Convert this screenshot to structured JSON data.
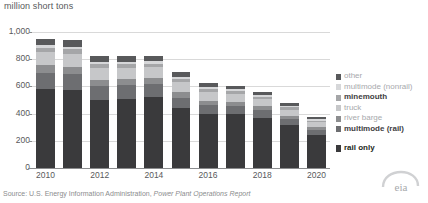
{
  "chart_data": {
    "type": "bar",
    "subtype": "stacked-bar",
    "title": "",
    "ylabel": "million short tons",
    "xlabel": "",
    "ylim": [
      0,
      1000
    ],
    "yticks": [
      0,
      200,
      400,
      600,
      800,
      1000
    ],
    "ytick_labels": [
      "0",
      "200",
      "400",
      "600",
      "800",
      "1,000"
    ],
    "grid": true,
    "legend_position": "right",
    "categories": [
      2010,
      2011,
      2012,
      2013,
      2014,
      2015,
      2016,
      2017,
      2018,
      2019,
      2020
    ],
    "xtick_labels": [
      "2010",
      "",
      "2012",
      "",
      "2014",
      "",
      "2016",
      "",
      "2018",
      "",
      "2020"
    ],
    "series": [
      {
        "name": "rail only",
        "color": "#3a3a3c",
        "values": [
          582,
          575,
          500,
          508,
          524,
          440,
          395,
          396,
          370,
          313,
          244
        ]
      },
      {
        "name": "multimode (rail)",
        "color": "#6d6e71",
        "values": [
          116,
          115,
          100,
          100,
          92,
          78,
          66,
          62,
          56,
          47,
          38
        ]
      },
      {
        "name": "river barge",
        "color": "#8c8d8f",
        "values": [
          57,
          56,
          50,
          47,
          45,
          40,
          33,
          30,
          27,
          22,
          17
        ]
      },
      {
        "name": "truck",
        "color": "#c6c7c9",
        "values": [
          95,
          95,
          84,
          82,
          80,
          72,
          63,
          56,
          52,
          46,
          36
        ]
      },
      {
        "name": "minemouth",
        "color": "#a5a6a8",
        "values": [
          32,
          31,
          28,
          26,
          26,
          24,
          22,
          21,
          20,
          17,
          14
        ]
      },
      {
        "name": "multimode (nonrail)",
        "color": "#d6d7d9",
        "values": [
          22,
          21,
          19,
          18,
          18,
          16,
          14,
          13,
          12,
          10,
          8
        ]
      },
      {
        "name": "other",
        "color": "#58595b",
        "values": [
          47,
          46,
          41,
          39,
          38,
          34,
          30,
          28,
          25,
          21,
          16
        ]
      }
    ],
    "totals": [
      951,
      939,
      822,
      820,
      823,
      704,
      623,
      606,
      562,
      476,
      373
    ]
  },
  "legend": {
    "items": [
      {
        "label": "other",
        "color": "#58595b",
        "bold": false
      },
      {
        "label": "multimode (nonrail)",
        "color": "#d6d7d9",
        "bold": false
      },
      {
        "label": "minemouth",
        "color": "#a5a6a8",
        "bold": true
      },
      {
        "label": "truck",
        "color": "#c6c7c9",
        "bold": false
      },
      {
        "label": "river barge",
        "color": "#8c8d8f",
        "bold": false
      },
      {
        "label": "multimode (rail)",
        "color": "#6d6e71",
        "bold": true
      }
    ],
    "rail_only": {
      "label": "rail only",
      "color": "#3a3a3c",
      "bold": true
    }
  },
  "footer": {
    "source_prefix": "Source: U.S. Energy Information Administration, ",
    "source_report": "Power Plant Operations Report",
    "logo": "eia-logo"
  }
}
